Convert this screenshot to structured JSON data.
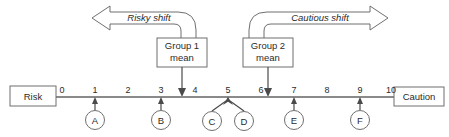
{
  "diagram": {
    "scale": {
      "left_endpoint_label": "Risk",
      "right_endpoint_label": "Caution",
      "tick_labels": [
        "0",
        "1",
        "2",
        "3",
        "4",
        "5",
        "6",
        "7",
        "8",
        "9",
        "10"
      ],
      "min": 0,
      "max": 10
    },
    "callouts": [
      {
        "id": "group1",
        "label_line1": "Group 1",
        "label_line2": "mean",
        "points_to_value": 3.6
      },
      {
        "id": "group2",
        "label_line1": "Group 2",
        "label_line2": "mean",
        "points_to_value": 6.4
      }
    ],
    "shift_arrows": [
      {
        "id": "risky",
        "label": "Risky shift",
        "direction": "left"
      },
      {
        "id": "cautious",
        "label": "Cautious shift",
        "direction": "right"
      }
    ],
    "markers": [
      {
        "label": "A",
        "value": 1
      },
      {
        "label": "B",
        "value": 3
      },
      {
        "label": "C",
        "value": 5
      },
      {
        "label": "D",
        "value": 5
      },
      {
        "label": "E",
        "value": 7
      },
      {
        "label": "F",
        "value": 9
      }
    ],
    "colors": {
      "line": "#8a8a8a",
      "stroke": "#6f6f6f",
      "text": "#2b2b2b",
      "pointer": "#4a4a4a",
      "background": "#ffffff"
    }
  }
}
